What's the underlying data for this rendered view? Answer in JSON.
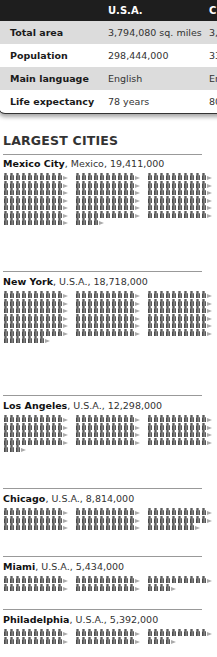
{
  "table": {
    "columns": [
      "",
      "U.S.A.",
      "C"
    ],
    "rows": [
      {
        "label": "Total area",
        "usa": "3,794,080 sq. miles",
        "other": "3,"
      },
      {
        "label": "Population",
        "usa": "298,444,000",
        "other": "33"
      },
      {
        "label": "Main language",
        "usa": "English",
        "other": "En"
      },
      {
        "label": "Life expectancy",
        "usa": "78 years",
        "other": "80"
      }
    ]
  },
  "section_title": "LARGEST CITIES",
  "cities": [
    {
      "name": "Mexico City",
      "rest": ", Mexico, 19,411,000"
    },
    {
      "name": "New York",
      "rest": ", U.S.A., 18,718,000"
    },
    {
      "name": "Los Angeles",
      "rest": ", U.S.A., 12,298,000"
    },
    {
      "name": "Chicago",
      "rest": ", U.S.A., 8,814,000"
    },
    {
      "name": "Miami",
      "rest": ", U.S.A., 5,434,000"
    },
    {
      "name": "Philadelphia",
      "rest": ", U.S.A., 5,392,000"
    }
  ],
  "chart_data": {
    "type": "bar",
    "title": "LARGEST CITIES",
    "subtitle": "Pictogram: each figure = 100,000 people; each group of 10 figures = 1,000,000",
    "categories": [
      "Mexico City, Mexico",
      "New York, U.S.A.",
      "Los Angeles, U.S.A.",
      "Chicago, U.S.A.",
      "Miami, U.S.A.",
      "Philadelphia, U.S.A."
    ],
    "values": [
      19411000,
      18718000,
      12298000,
      8814000,
      5434000,
      5392000
    ],
    "figures": [
      194,
      187,
      123,
      88,
      54,
      54
    ],
    "xlabel": "",
    "ylabel": "Population",
    "grid": false,
    "legend": "none"
  },
  "colors": {
    "header_bg": "#1e1e1e",
    "shade_row": "#dcdcdc",
    "figure": "#555555"
  }
}
